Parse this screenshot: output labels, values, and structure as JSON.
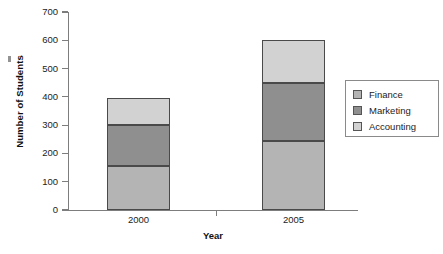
{
  "chart_data": {
    "type": "bar",
    "subtype": "stacked",
    "title": "",
    "xlabel": "Year",
    "ylabel": "Number of Students",
    "categories": [
      "2000",
      "2005"
    ],
    "ylim": [
      0,
      700
    ],
    "yticks": [
      0,
      100,
      200,
      300,
      400,
      500,
      600,
      700
    ],
    "ytick_labels": [
      "0",
      "100",
      "200",
      "300",
      "400",
      "500",
      "600",
      "700"
    ],
    "grid": false,
    "legend_position": "right",
    "series": [
      {
        "name": "Finance",
        "color": "#b4b4b4",
        "values": [
          155,
          245
        ]
      },
      {
        "name": "Marketing",
        "color": "#8f8f8f",
        "values": [
          145,
          205
        ]
      },
      {
        "name": "Accounting",
        "color": "#d2d2d2",
        "values": [
          97,
          150
        ]
      }
    ],
    "totals": [
      397,
      600
    ],
    "stack_boundaries": {
      "2000": [
        0,
        155,
        300,
        397
      ],
      "2005": [
        0,
        245,
        450,
        600
      ]
    },
    "axis_color": "#7d7d7d",
    "bar_edge_color": "#4a4a4a"
  },
  "legend": {
    "items": [
      {
        "label": "Finance",
        "color": "#b4b4b4"
      },
      {
        "label": "Marketing",
        "color": "#8f8f8f"
      },
      {
        "label": "Accounting",
        "color": "#d2d2d2"
      }
    ]
  }
}
